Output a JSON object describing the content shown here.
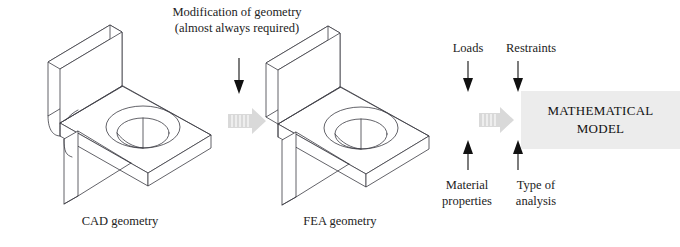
{
  "diagram": {
    "title_note": "Modification of geometry (almost always required)",
    "title_note_line1": "Modification of geometry",
    "title_note_line2": "(almost always required)",
    "stages": [
      {
        "id": "cad",
        "caption": "CAD geometry",
        "description": "Isometric L-bracket with filleted edges, support rib and counterbored hole"
      },
      {
        "id": "fea",
        "caption": "FEA geometry",
        "description": "Isometric L-bracket simplified with sharp edges, support rib and counterbored hole"
      }
    ],
    "inputs_top": [
      {
        "label": "Loads"
      },
      {
        "label": "Restraints"
      }
    ],
    "inputs_bottom": [
      {
        "label": "Material properties",
        "line1": "Material",
        "line2": "properties"
      },
      {
        "label": "Type of analysis",
        "line1": "Type of",
        "line2": "analysis"
      }
    ],
    "result": {
      "line1": "MATHEMATICAL",
      "line2": "MODEL",
      "background": "#ececec"
    },
    "colors": {
      "line": "#3b3b42",
      "text": "#222222",
      "block_arrow": "#d9d9d9",
      "thin_arrow": "#111111",
      "canvas": "#ffffff"
    },
    "flow_arrows": [
      {
        "name": "down-arrow-modification",
        "direction": "down"
      },
      {
        "name": "block-arrow-cad-to-fea",
        "direction": "right"
      },
      {
        "name": "block-arrow-fea-to-model",
        "direction": "right"
      },
      {
        "name": "down-arrow-loads",
        "direction": "down"
      },
      {
        "name": "down-arrow-restraints",
        "direction": "down"
      },
      {
        "name": "up-arrow-material-properties",
        "direction": "up"
      },
      {
        "name": "up-arrow-type-of-analysis",
        "direction": "up"
      }
    ]
  }
}
